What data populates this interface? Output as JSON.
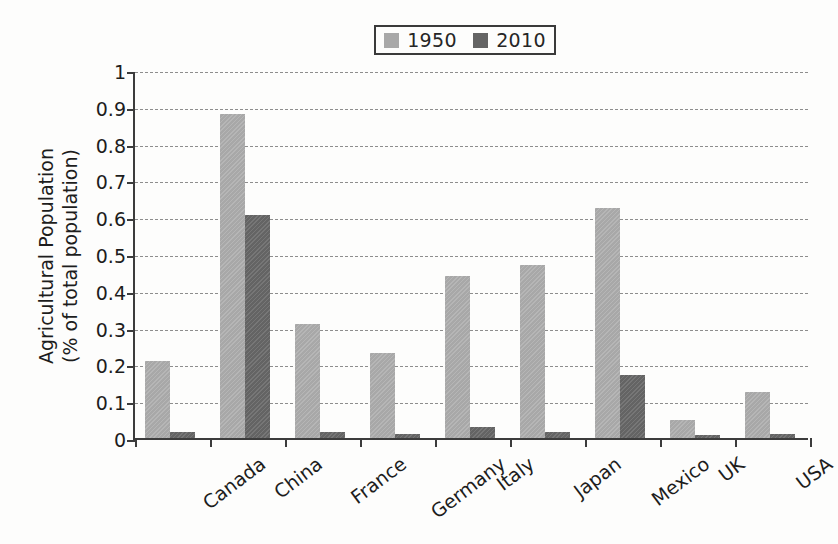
{
  "chart_data": {
    "type": "bar",
    "title": "",
    "xlabel": "",
    "ylabel_line1": "Agricultural Population",
    "ylabel_line2": "(% of total population)",
    "ylim": [
      0,
      1
    ],
    "ytick_labels": [
      "1",
      "0.9",
      "0.8",
      "0.7",
      "0.6",
      "0.5",
      "0.4",
      "0.3",
      "0.2",
      "0.1",
      "0"
    ],
    "ytick_values": [
      1,
      0.9,
      0.8,
      0.7,
      0.6,
      0.5,
      0.4,
      0.3,
      0.2,
      0.1,
      0
    ],
    "grid": true,
    "legend_position": "top-center",
    "categories": [
      "Canada",
      "China",
      "France",
      "Germany",
      "Italy",
      "Japan",
      "Mexico",
      "UK",
      "USA"
    ],
    "series": [
      {
        "name": "1950",
        "color": "#a8a8a8",
        "values": [
          0.21,
          0.88,
          0.31,
          0.23,
          0.44,
          0.47,
          0.625,
          0.05,
          0.125
        ]
      },
      {
        "name": "2010",
        "color": "#646464",
        "values": [
          0.015,
          0.605,
          0.015,
          0.01,
          0.03,
          0.015,
          0.17,
          0.008,
          0.012
        ]
      }
    ]
  },
  "legend": {
    "entries": [
      {
        "label": "1950",
        "swatch_name": "legend-swatch-1950"
      },
      {
        "label": "2010",
        "swatch_name": "legend-swatch-2010"
      }
    ]
  },
  "colors": {
    "series_1950": "#a8a8a8",
    "series_2010": "#646464",
    "axis": "#3c3c3c",
    "grid": "#8d8d8d",
    "background": "#fdfdfc",
    "text": "#1d1d1d"
  }
}
